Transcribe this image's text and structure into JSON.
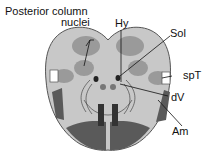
{
  "diagram": {
    "labels": {
      "posterior_line1": "Posterior column",
      "posterior_line2": "nuclei",
      "hy": "Hy",
      "sol": "Sol",
      "spt": "spT",
      "dv": "dV",
      "am": "Am"
    },
    "colors": {
      "outline": "#555555",
      "base_light": "#c8c8c8",
      "nuclei_mid": "#9a9a9a",
      "tract_dark": "#5a5a5a",
      "pyramid_dark": "#3a3a3a",
      "background": "#ffffff"
    }
  }
}
